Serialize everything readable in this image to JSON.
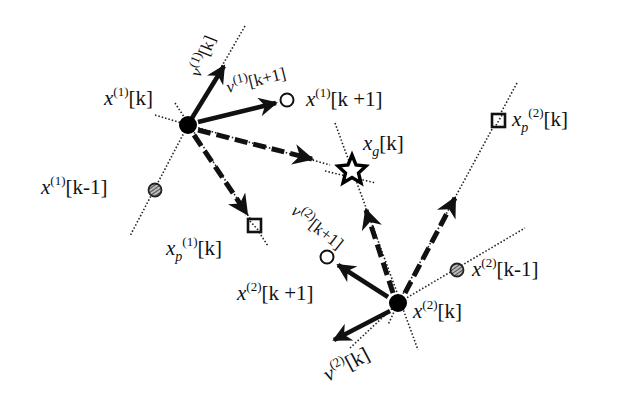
{
  "diagram": {
    "colors": {
      "ink": "#111111",
      "background": "#ffffff",
      "hatched_fill": "#888888"
    },
    "agents": [
      {
        "id": 1,
        "current": {
          "label_base": "x",
          "label_sup": "(1)",
          "label_idx": "[k]",
          "shape": "filled-circle"
        },
        "next": {
          "label_base": "x",
          "label_sup": "(1)",
          "label_idx": "[k +1]",
          "shape": "open-circle"
        },
        "previous": {
          "label_base": "x",
          "label_sup": "(1)",
          "label_idx": "[k-1]",
          "shape": "hatched-circle"
        },
        "personal_best": {
          "label_base": "x",
          "label_sub": "p",
          "label_sup": "(1)",
          "label_idx": "[k]",
          "shape": "square"
        },
        "velocity": {
          "label_base": "v",
          "label_sup": "(1)",
          "label_idx": "[k]"
        },
        "velocity_next": {
          "label_base": "v",
          "label_sup": "(1)",
          "label_idx": "[k+1]"
        }
      },
      {
        "id": 2,
        "current": {
          "label_base": "x",
          "label_sup": "(2)",
          "label_idx": "[k]",
          "shape": "filled-circle"
        },
        "next": {
          "label_base": "x",
          "label_sup": "(2)",
          "label_idx": "[k +1]",
          "shape": "open-circle"
        },
        "previous": {
          "label_base": "x",
          "label_sup": "(2)",
          "label_idx": "[k-1]",
          "shape": "hatched-circle"
        },
        "personal_best": {
          "label_base": "x",
          "label_sub": "p",
          "label_sup": "(2)",
          "label_idx": "[k]",
          "shape": "square"
        },
        "velocity": {
          "label_base": "v",
          "label_sup": "(2)",
          "label_idx": "[k]"
        },
        "velocity_next": {
          "label_base": "v",
          "label_sup": "(2)",
          "label_idx": "[k+1]"
        }
      }
    ],
    "global_best": {
      "label_base": "x",
      "label_sub": "g",
      "label_idx": "[k]",
      "shape": "star"
    }
  }
}
